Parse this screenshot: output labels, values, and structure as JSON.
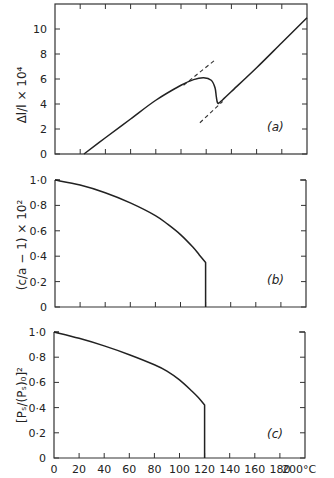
{
  "chart_data": [
    {
      "type": "line",
      "panel": "(a)",
      "ylabel": "Δl/l × 10⁴",
      "xlabel": "",
      "xlim": [
        0,
        200
      ],
      "ylim": [
        0,
        12
      ],
      "yticks": [
        0,
        2,
        4,
        6,
        8,
        10
      ],
      "ytick_labels": [
        "0",
        "2",
        "4",
        "6",
        "8",
        "10"
      ],
      "xticks": [
        0,
        20,
        40,
        60,
        80,
        100,
        120,
        140,
        160,
        180,
        200
      ],
      "box": true,
      "series": [
        {
          "name": "expansion",
          "x": [
            23,
            40,
            60,
            80,
            100,
            110,
            118,
            124,
            127,
            128,
            129,
            131,
            140,
            160,
            180,
            200
          ],
          "y": [
            0,
            1.3,
            2.8,
            4.3,
            5.5,
            5.95,
            6.1,
            5.9,
            5.3,
            4.6,
            4.1,
            4.15,
            5.0,
            6.9,
            8.9,
            10.9
          ]
        }
      ],
      "dashed_lines": [
        {
          "x": [
            102,
            128
          ],
          "y": [
            5.5,
            7.6
          ]
        },
        {
          "x": [
            115,
            133
          ],
          "y": [
            2.5,
            4.2
          ]
        }
      ]
    },
    {
      "type": "line",
      "panel": "(b)",
      "ylabel": "(c/a − 1) × 10²",
      "xlabel": "",
      "xlim": [
        0,
        200
      ],
      "ylim": [
        0,
        1.0
      ],
      "yticks": [
        0,
        0.2,
        0.4,
        0.6,
        0.8,
        1.0
      ],
      "ytick_labels": [
        "0",
        "0·2",
        "0·4",
        "0·6",
        "0·8",
        "1·0"
      ],
      "xticks": [
        0,
        20,
        40,
        60,
        80,
        100,
        120,
        140,
        160,
        180,
        200
      ],
      "box": false,
      "series": [
        {
          "name": "tetragonality",
          "x": [
            0,
            20,
            40,
            60,
            80,
            90,
            100,
            110,
            115,
            120,
            120
          ],
          "y": [
            1.0,
            0.96,
            0.9,
            0.82,
            0.72,
            0.65,
            0.57,
            0.47,
            0.41,
            0.35,
            0
          ]
        }
      ]
    },
    {
      "type": "line",
      "panel": "(c)",
      "ylabel": "[Pₛ/(Pₛ)₀]²",
      "xlabel": "°C",
      "xlim": [
        0,
        200
      ],
      "ylim": [
        0,
        1.0
      ],
      "yticks": [
        0,
        0.2,
        0.4,
        0.6,
        0.8,
        1.0
      ],
      "ytick_labels": [
        "0",
        "0·2",
        "0·4",
        "0·6",
        "0·8",
        "1·0"
      ],
      "xticks": [
        0,
        20,
        40,
        60,
        80,
        100,
        120,
        140,
        160,
        180,
        200
      ],
      "xtick_labels": [
        "0",
        "20",
        "40",
        "60",
        "80",
        "100",
        "120",
        "140",
        "160",
        "180",
        "200°C"
      ],
      "box": false,
      "series": [
        {
          "name": "polarization squared",
          "x": [
            0,
            20,
            40,
            60,
            80,
            90,
            100,
            110,
            115,
            120,
            120
          ],
          "y": [
            1.0,
            0.95,
            0.89,
            0.82,
            0.74,
            0.69,
            0.62,
            0.53,
            0.48,
            0.42,
            0
          ]
        }
      ]
    }
  ],
  "labels": {
    "panel_a": "(a)",
    "panel_b": "(b)",
    "panel_c": "(c)"
  }
}
